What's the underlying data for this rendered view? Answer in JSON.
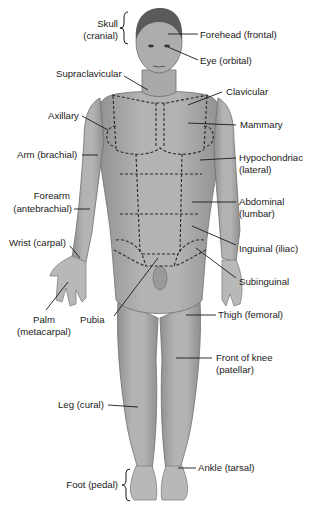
{
  "figure": {
    "colors": {
      "skin": "#a9a9a9",
      "outline": "#6e6e6e",
      "text": "#1a1a1a",
      "background": "#ffffff"
    }
  },
  "labels": {
    "skull": [
      "Skull",
      "(cranial)"
    ],
    "forehead": "Forehead (frontal)",
    "eye": "Eye (orbital)",
    "supraclavicular": "Supraclavicular",
    "clavicular": "Clavicular",
    "axillary": "Axillary",
    "mammary": "Mammary",
    "arm": "Arm (brachial)",
    "hypochondriac": [
      "Hypochondriac",
      "(lateral)"
    ],
    "forearm": [
      "Forearm",
      "(antebrachial)"
    ],
    "abdominal": [
      "Abdominal",
      "(lumbar)"
    ],
    "wrist": "Wrist (carpal)",
    "inguinal": "Inguinal (iliac)",
    "subinguinal": "Subinguinal",
    "palm": [
      "Palm",
      "(metacarpal)"
    ],
    "pubia": "Pubia",
    "thigh": "Thigh (femoral)",
    "knee": [
      "Front of knee",
      "(patellar)"
    ],
    "leg": "Leg (cural)",
    "ankle": "Ankle (tarsal)",
    "foot": "Foot (pedal)"
  }
}
